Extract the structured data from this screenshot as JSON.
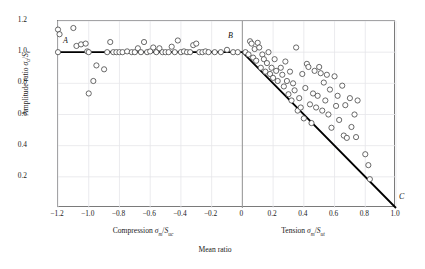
{
  "chart_data": {
    "type": "scatter",
    "title": "",
    "xlabel": "Mean ratio",
    "ylabel": "Amplitude ratio σa/Se",
    "xlabel_left": "Compression σm/Suc",
    "xlabel_right": "Tension σm/Sut",
    "xlim": [
      -1.2,
      1.0
    ],
    "ylim": [
      0.0,
      1.2
    ],
    "xticks": [
      -1.2,
      -1.0,
      -0.8,
      -0.6,
      -0.4,
      -0.2,
      0,
      0.2,
      0.4,
      0.6,
      0.8,
      1.0
    ],
    "xtick_labels": [
      "−1.2",
      "−1.0",
      "−0.8",
      "−0.6",
      "−0.4",
      "−0.2",
      "0",
      "0.2",
      "0.4",
      "0.6",
      "0.8",
      "1.0"
    ],
    "yticks": [
      0.2,
      0.4,
      0.6,
      0.8,
      1.0,
      1.2
    ],
    "ytick_labels": [
      "0.2",
      "0.4",
      "0.6",
      "0.8",
      "1.0",
      "1.2"
    ],
    "grid": true,
    "grid_color": "#e6e6ea",
    "axis_color": "#7a7a7a",
    "marker": {
      "shape": "circle-open",
      "edge_color": "#3a3a3a",
      "face_color": "#ffffff",
      "radius_px": 2.6
    },
    "annotations": [
      {
        "label": "A",
        "x": -1.12,
        "y": 1.05
      },
      {
        "label": "B",
        "x": -0.03,
        "y": 1.08
      },
      {
        "label": "C",
        "x": 1.03,
        "y": 0.08
      }
    ],
    "series": [
      {
        "name": "Goodman failure line",
        "type": "line",
        "color": "#000000",
        "width_px": 1.8,
        "points": [
          [
            -1.2,
            1.0
          ],
          [
            0.0,
            1.0
          ],
          [
            1.0,
            0.0
          ]
        ]
      },
      {
        "name": "Compression test data",
        "type": "scatter",
        "points": [
          [
            -1.2,
            1.145
          ],
          [
            -1.19,
            1.115
          ],
          [
            -1.2,
            1.0
          ],
          [
            -1.1,
            1.155
          ],
          [
            -1.08,
            1.04
          ],
          [
            -1.05,
            1.05
          ],
          [
            -1.02,
            1.055
          ],
          [
            -1.01,
            1.005
          ],
          [
            -1.0,
            1.0
          ],
          [
            -1.0,
            0.735
          ],
          [
            -0.97,
            0.815
          ],
          [
            -0.95,
            0.915
          ],
          [
            -0.9,
            0.89
          ],
          [
            -0.88,
            1.0
          ],
          [
            -0.86,
            1.065
          ],
          [
            -0.84,
            1.0
          ],
          [
            -0.82,
            1.0
          ],
          [
            -0.8,
            1.0
          ],
          [
            -0.78,
            1.0
          ],
          [
            -0.75,
            1.005
          ],
          [
            -0.72,
            1.0
          ],
          [
            -0.7,
            1.0
          ],
          [
            -0.68,
            1.025
          ],
          [
            -0.66,
            1.0
          ],
          [
            -0.64,
            1.065
          ],
          [
            -0.62,
            1.0
          ],
          [
            -0.6,
            1.005
          ],
          [
            -0.58,
            1.03
          ],
          [
            -0.56,
            1.0
          ],
          [
            -0.54,
            1.025
          ],
          [
            -0.52,
            1.0
          ],
          [
            -0.5,
            1.0
          ],
          [
            -0.48,
            1.0
          ],
          [
            -0.46,
            1.035
          ],
          [
            -0.44,
            1.0
          ],
          [
            -0.42,
            1.075
          ],
          [
            -0.4,
            1.0
          ],
          [
            -0.38,
            1.005
          ],
          [
            -0.36,
            1.0
          ],
          [
            -0.34,
            1.0
          ],
          [
            -0.32,
            1.045
          ],
          [
            -0.3,
            1.055
          ],
          [
            -0.28,
            1.0
          ],
          [
            -0.26,
            1.0
          ],
          [
            -0.24,
            1.005
          ],
          [
            -0.22,
            1.0
          ],
          [
            -0.18,
            1.0
          ],
          [
            -0.14,
            1.0
          ],
          [
            -0.1,
            1.015
          ],
          [
            -0.06,
            1.0
          ],
          [
            -0.03,
            1.0
          ]
        ]
      },
      {
        "name": "Tension test data",
        "type": "scatter",
        "points": [
          [
            0.02,
            1.0
          ],
          [
            0.04,
            0.985
          ],
          [
            0.05,
            1.07
          ],
          [
            0.06,
            1.055
          ],
          [
            0.07,
            0.965
          ],
          [
            0.08,
            1.02
          ],
          [
            0.09,
            0.945
          ],
          [
            0.1,
            1.06
          ],
          [
            0.11,
            1.03
          ],
          [
            0.12,
            0.9
          ],
          [
            0.13,
            0.985
          ],
          [
            0.14,
            0.955
          ],
          [
            0.15,
            0.875
          ],
          [
            0.16,
            0.93
          ],
          [
            0.17,
            1.0
          ],
          [
            0.18,
            0.86
          ],
          [
            0.19,
            0.9
          ],
          [
            0.2,
            0.835
          ],
          [
            0.21,
            0.955
          ],
          [
            0.22,
            0.88
          ],
          [
            0.23,
            0.815
          ],
          [
            0.25,
            0.9
          ],
          [
            0.26,
            0.855
          ],
          [
            0.27,
            0.78
          ],
          [
            0.28,
            0.94
          ],
          [
            0.29,
            0.815
          ],
          [
            0.3,
            0.73
          ],
          [
            0.31,
            0.875
          ],
          [
            0.32,
            0.69
          ],
          [
            0.33,
            0.8
          ],
          [
            0.34,
            0.755
          ],
          [
            0.35,
            1.03
          ],
          [
            0.36,
            0.625
          ],
          [
            0.37,
            0.705
          ],
          [
            0.38,
            0.645
          ],
          [
            0.39,
            0.86
          ],
          [
            0.4,
            0.575
          ],
          [
            0.41,
            0.77
          ],
          [
            0.42,
            0.925
          ],
          [
            0.43,
            0.905
          ],
          [
            0.44,
            0.665
          ],
          [
            0.45,
            0.545
          ],
          [
            0.46,
            0.735
          ],
          [
            0.47,
            0.88
          ],
          [
            0.48,
            0.645
          ],
          [
            0.49,
            0.72
          ],
          [
            0.5,
            0.905
          ],
          [
            0.51,
            0.865
          ],
          [
            0.52,
            0.625
          ],
          [
            0.53,
            0.805
          ],
          [
            0.54,
            0.69
          ],
          [
            0.55,
            0.855
          ],
          [
            0.56,
            0.6
          ],
          [
            0.57,
            0.76
          ],
          [
            0.58,
            0.515
          ],
          [
            0.6,
            0.845
          ],
          [
            0.61,
            0.655
          ],
          [
            0.62,
            0.72
          ],
          [
            0.63,
            0.565
          ],
          [
            0.65,
            0.785
          ],
          [
            0.66,
            0.465
          ],
          [
            0.67,
            0.66
          ],
          [
            0.68,
            0.45
          ],
          [
            0.7,
            0.705
          ],
          [
            0.71,
            0.52
          ],
          [
            0.73,
            0.6
          ],
          [
            0.74,
            0.455
          ],
          [
            0.75,
            0.69
          ],
          [
            0.8,
            0.345
          ],
          [
            0.82,
            0.275
          ],
          [
            0.83,
            0.185
          ]
        ]
      }
    ]
  }
}
